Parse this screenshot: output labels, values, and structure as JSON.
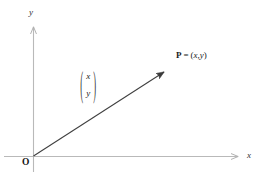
{
  "figure": {
    "type": "vector-diagram",
    "background_color": "#ffffff",
    "axis_color": "#b9b9b9",
    "vector_color": "#3a3a3a",
    "text_color": "#111111"
  },
  "axes": {
    "x": {
      "label": "x",
      "start": {
        "x": 4,
        "y": 156
      },
      "end": {
        "x": 243,
        "y": 156
      },
      "arrow": "right"
    },
    "y": {
      "label": "y",
      "start": {
        "x": 33,
        "y": 172
      },
      "end": {
        "x": 33,
        "y": 22
      },
      "arrow": "up"
    }
  },
  "origin": {
    "label": "O",
    "x": 33,
    "y": 156
  },
  "vector": {
    "from": {
      "x": 33,
      "y": 156
    },
    "to": {
      "x": 168,
      "y": 69
    },
    "arrow": "to-end"
  },
  "point": {
    "name": "P",
    "equals": "=",
    "coordinates": "(x, y)",
    "coord_open": "(",
    "coord_x": "x",
    "coord_comma": ",",
    "coord_y": "y",
    "coord_close": ")"
  },
  "column_vector": {
    "open_paren": "(",
    "close_paren": ")",
    "top": "x",
    "bottom": "y"
  }
}
